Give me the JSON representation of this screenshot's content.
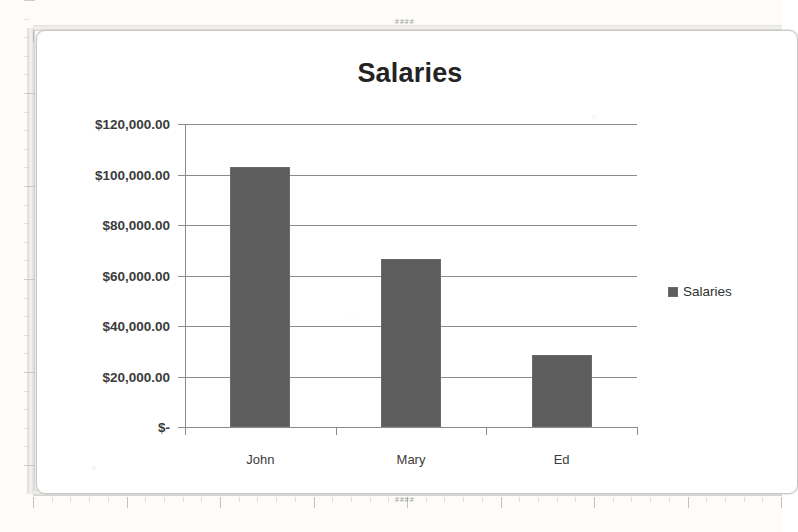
{
  "document": {
    "kind": "scanned-chart-page",
    "ruler_marks": "####"
  },
  "chart_data": {
    "type": "bar",
    "title": "Salaries",
    "categories": [
      "John",
      "Mary",
      "Ed"
    ],
    "values": [
      103000,
      66500,
      28500
    ],
    "series": [
      {
        "name": "Salaries",
        "values": [
          103000,
          66500,
          28500
        ]
      }
    ],
    "xlabel": "",
    "ylabel": "",
    "ylim": [
      0,
      120000
    ],
    "ytick_values": [
      120000,
      100000,
      80000,
      60000,
      40000,
      20000,
      0
    ],
    "ytick_labels": [
      "$120,000.00",
      "$100,000.00",
      "$80,000.00",
      "$60,000.00",
      "$40,000.00",
      "$20,000.00",
      "$-"
    ],
    "grid": true,
    "legend": {
      "position": "right",
      "entries": [
        "Salaries"
      ]
    },
    "colors": {
      "bar": "#5d5d5d",
      "grid": "#8c8a86",
      "text": "#3b3b3b",
      "title": "#232323"
    }
  },
  "legend": {
    "label": "Salaries"
  }
}
